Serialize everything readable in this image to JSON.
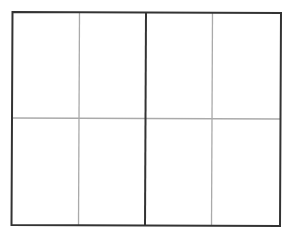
{
  "diagram": {
    "type": "grid",
    "rows": 2,
    "columns": 4,
    "major_divider_after_column": 2,
    "colors": {
      "outer_border": "#333333",
      "major_divider": "#333333",
      "minor_lines": "#aaaaaa",
      "background": "#ffffff"
    }
  }
}
